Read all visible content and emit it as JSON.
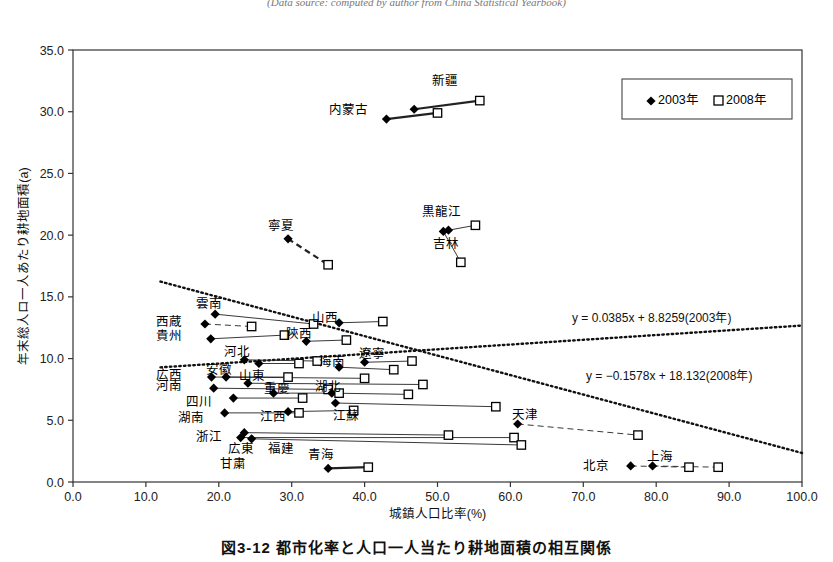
{
  "headnote": "(Data source: computed by author from China Statistical Yearbook)",
  "figcaption": "図3-12 都市化率と人口一人当たり耕地面積の相互関係",
  "axes": {
    "xlabel": "城鎮人口比率(%)",
    "ylabel": "年末総人ロ一人あたり耕地面積(a)",
    "xticks": [
      "0.0",
      "10.0",
      "20.0",
      "30.0",
      "40.0",
      "50.0",
      "60.0",
      "70.0",
      "80.0",
      "90.0",
      "100.0"
    ],
    "yticks": [
      "0.0",
      "5.0",
      "10.0",
      "15.0",
      "20.0",
      "25.0",
      "30.0",
      "35.0"
    ],
    "xlim": [
      0,
      100
    ],
    "ylim": [
      0,
      35
    ]
  },
  "legend": {
    "items": [
      {
        "marker": "filled-diamond",
        "label": "2003年"
      },
      {
        "marker": "open-square",
        "label": "2008年"
      }
    ]
  },
  "annotations": {
    "eq2003": "y = 0.0385x + 8.8259(2003年)",
    "eq2008": "y = −0.1578x + 18.132(2008年)"
  },
  "chart_data": {
    "type": "scatter",
    "title": "図3-12 都市化率と人口一人当たり耕地面積の相互関係",
    "xlabel": "城鎮人口比率(%)",
    "ylabel": "年末総人ロ一人あたり耕地面積(a)",
    "xlim": [
      0,
      100
    ],
    "ylim": [
      0,
      35
    ],
    "grid": false,
    "legend_position": "top-right",
    "series": [
      {
        "name": "2003年",
        "marker": "filled-diamond"
      },
      {
        "name": "2008年",
        "marker": "open-square"
      }
    ],
    "trendlines": [
      {
        "name": "2003年",
        "slope": 0.0385,
        "intercept": 8.8259,
        "equation": "y = 0.0385x + 8.8259(2003年)",
        "style": "dotted"
      },
      {
        "name": "2008年",
        "slope": -0.1578,
        "intercept": 18.132,
        "equation": "y = −0.1578x + 18.132(2008年)",
        "style": "dotted"
      }
    ],
    "points": [
      {
        "label": "新疆",
        "x2003": 46.8,
        "y2003": 30.2,
        "x2008": 55.8,
        "y2008": 30.9,
        "lx": 51.0,
        "ly": 32.5,
        "anchor": "middle"
      },
      {
        "label": "内蒙古",
        "x2003": 43.0,
        "y2003": 29.4,
        "x2008": 50.0,
        "y2008": 29.9,
        "lx": 40.5,
        "ly": 30.2,
        "anchor": "end"
      },
      {
        "label": "黒龍江",
        "x2003": 51.5,
        "y2003": 20.4,
        "x2008": 55.2,
        "y2008": 20.8,
        "lx": 50.5,
        "ly": 21.9,
        "anchor": "middle"
      },
      {
        "label": "吉林",
        "x2003": 50.8,
        "y2003": 20.3,
        "x2008": 53.2,
        "y2008": 17.8,
        "lx": 51.2,
        "ly": 19.3,
        "anchor": "middle"
      },
      {
        "label": "寧夏",
        "x2003": 29.5,
        "y2003": 19.7,
        "x2008": 35.0,
        "y2008": 17.6,
        "lx": 28.5,
        "ly": 20.8,
        "anchor": "middle"
      },
      {
        "label": "雲南",
        "x2003": 19.5,
        "y2003": 13.6,
        "x2008": 33.0,
        "y2008": 12.8,
        "lx": 18.6,
        "ly": 14.5,
        "anchor": "middle"
      },
      {
        "label": "西蔵",
        "x2003": 18.1,
        "y2003": 12.8,
        "x2008": 24.5,
        "y2008": 12.6,
        "lx": 15.0,
        "ly": 13.0,
        "anchor": "end"
      },
      {
        "label": "山西",
        "x2003": 36.5,
        "y2003": 12.9,
        "x2008": 42.5,
        "y2008": 13.0,
        "lx": 34.5,
        "ly": 13.3,
        "anchor": "middle"
      },
      {
        "label": "貴州",
        "x2003": 18.9,
        "y2003": 11.6,
        "x2008": 29.0,
        "y2008": 11.9,
        "lx": 15.0,
        "ly": 11.9,
        "anchor": "end"
      },
      {
        "label": "陝西",
        "x2003": 32.0,
        "y2003": 11.4,
        "x2008": 37.5,
        "y2008": 11.5,
        "lx": 31.0,
        "ly": 12.0,
        "anchor": "middle"
      },
      {
        "label": "河北",
        "x2003": 23.5,
        "y2003": 9.9,
        "x2008": 33.5,
        "y2008": 9.8,
        "lx": 22.5,
        "ly": 10.6,
        "anchor": "middle"
      },
      {
        "label": "甘粛",
        "x2003": 25.5,
        "y2003": 9.6,
        "x2008": 31.0,
        "y2008": 9.6,
        "lx": 22.0,
        "ly": 1.5,
        "anchor": "middle"
      },
      {
        "label": "遼寧",
        "x2003": 40.0,
        "y2003": 9.7,
        "x2008": 46.5,
        "y2008": 9.8,
        "lx": 41.0,
        "ly": 10.4,
        "anchor": "middle"
      },
      {
        "label": "海南",
        "x2003": 36.5,
        "y2003": 9.3,
        "x2008": 44.0,
        "y2008": 9.1,
        "lx": 35.5,
        "ly": 9.8,
        "anchor": "middle"
      },
      {
        "label": "安徽",
        "x2003": 21.0,
        "y2003": 8.5,
        "x2008": 40.0,
        "y2008": 8.4,
        "lx": 20.0,
        "ly": 9.1,
        "anchor": "middle"
      },
      {
        "label": "広西",
        "x2003": 19.0,
        "y2003": 8.5,
        "x2008": 29.5,
        "y2008": 8.5,
        "lx": 15.0,
        "ly": 8.7,
        "anchor": "end"
      },
      {
        "label": "山東",
        "x2003": 24.0,
        "y2003": 8.0,
        "x2008": 48.0,
        "y2008": 7.9,
        "lx": 24.5,
        "ly": 8.6,
        "anchor": "middle"
      },
      {
        "label": "河南",
        "x2003": 19.3,
        "y2003": 7.6,
        "x2008": 35.0,
        "y2008": 7.5,
        "lx": 15.0,
        "ly": 7.8,
        "anchor": "end"
      },
      {
        "label": "湖北",
        "x2003": 35.5,
        "y2003": 7.2,
        "x2008": 46.0,
        "y2008": 7.1,
        "lx": 35.0,
        "ly": 7.7,
        "anchor": "middle"
      },
      {
        "label": "重慶",
        "x2003": 27.5,
        "y2003": 7.2,
        "x2008": 36.5,
        "y2008": 7.2,
        "lx": 28.0,
        "ly": 7.6,
        "anchor": "middle"
      },
      {
        "label": "四川",
        "x2003": 22.0,
        "y2003": 6.8,
        "x2008": 31.5,
        "y2008": 6.8,
        "lx": 19.0,
        "ly": 6.5,
        "anchor": "end"
      },
      {
        "label": "江蘇",
        "x2003": 36.0,
        "y2003": 6.4,
        "x2008": 58.0,
        "y2008": 6.1,
        "lx": 37.5,
        "ly": 5.4,
        "anchor": "middle"
      },
      {
        "label": "江西",
        "x2003": 29.5,
        "y2003": 5.7,
        "x2008": 38.5,
        "y2008": 5.8,
        "lx": 27.5,
        "ly": 5.3,
        "anchor": "middle"
      },
      {
        "label": "湖南",
        "x2003": 20.8,
        "y2003": 5.6,
        "x2008": 31.0,
        "y2008": 5.6,
        "lx": 18.0,
        "ly": 5.2,
        "anchor": "end"
      },
      {
        "label": "浙江",
        "x2003": 23.5,
        "y2003": 4.0,
        "x2008": 51.5,
        "y2008": 3.8,
        "lx": 20.5,
        "ly": 3.7,
        "anchor": "end"
      },
      {
        "label": "広東",
        "x2003": 23.0,
        "y2003": 3.6,
        "x2008": 60.5,
        "y2008": 3.6,
        "lx": 23.0,
        "ly": 2.7,
        "anchor": "middle"
      },
      {
        "label": "福建",
        "x2003": 24.5,
        "y2003": 3.5,
        "x2008": 61.5,
        "y2008": 3.0,
        "lx": 28.5,
        "ly": 2.7,
        "anchor": "middle"
      },
      {
        "label": "天津",
        "x2003": 61.0,
        "y2003": 4.7,
        "x2008": 77.5,
        "y2008": 3.8,
        "lx": 62.0,
        "ly": 5.5,
        "anchor": "middle"
      },
      {
        "label": "北京",
        "x2003": 76.5,
        "y2003": 1.3,
        "x2008": 84.5,
        "y2008": 1.2,
        "lx": 73.5,
        "ly": 1.3,
        "anchor": "end"
      },
      {
        "label": "上海",
        "x2003": 79.5,
        "y2003": 1.3,
        "x2008": 88.5,
        "y2008": 1.2,
        "lx": 80.5,
        "ly": 2.1,
        "anchor": "middle"
      },
      {
        "label": "青海",
        "x2003": 35.0,
        "y2003": 1.1,
        "x2008": 40.5,
        "y2008": 1.2,
        "lx": 34.0,
        "ly": 2.2,
        "anchor": "middle"
      }
    ]
  }
}
